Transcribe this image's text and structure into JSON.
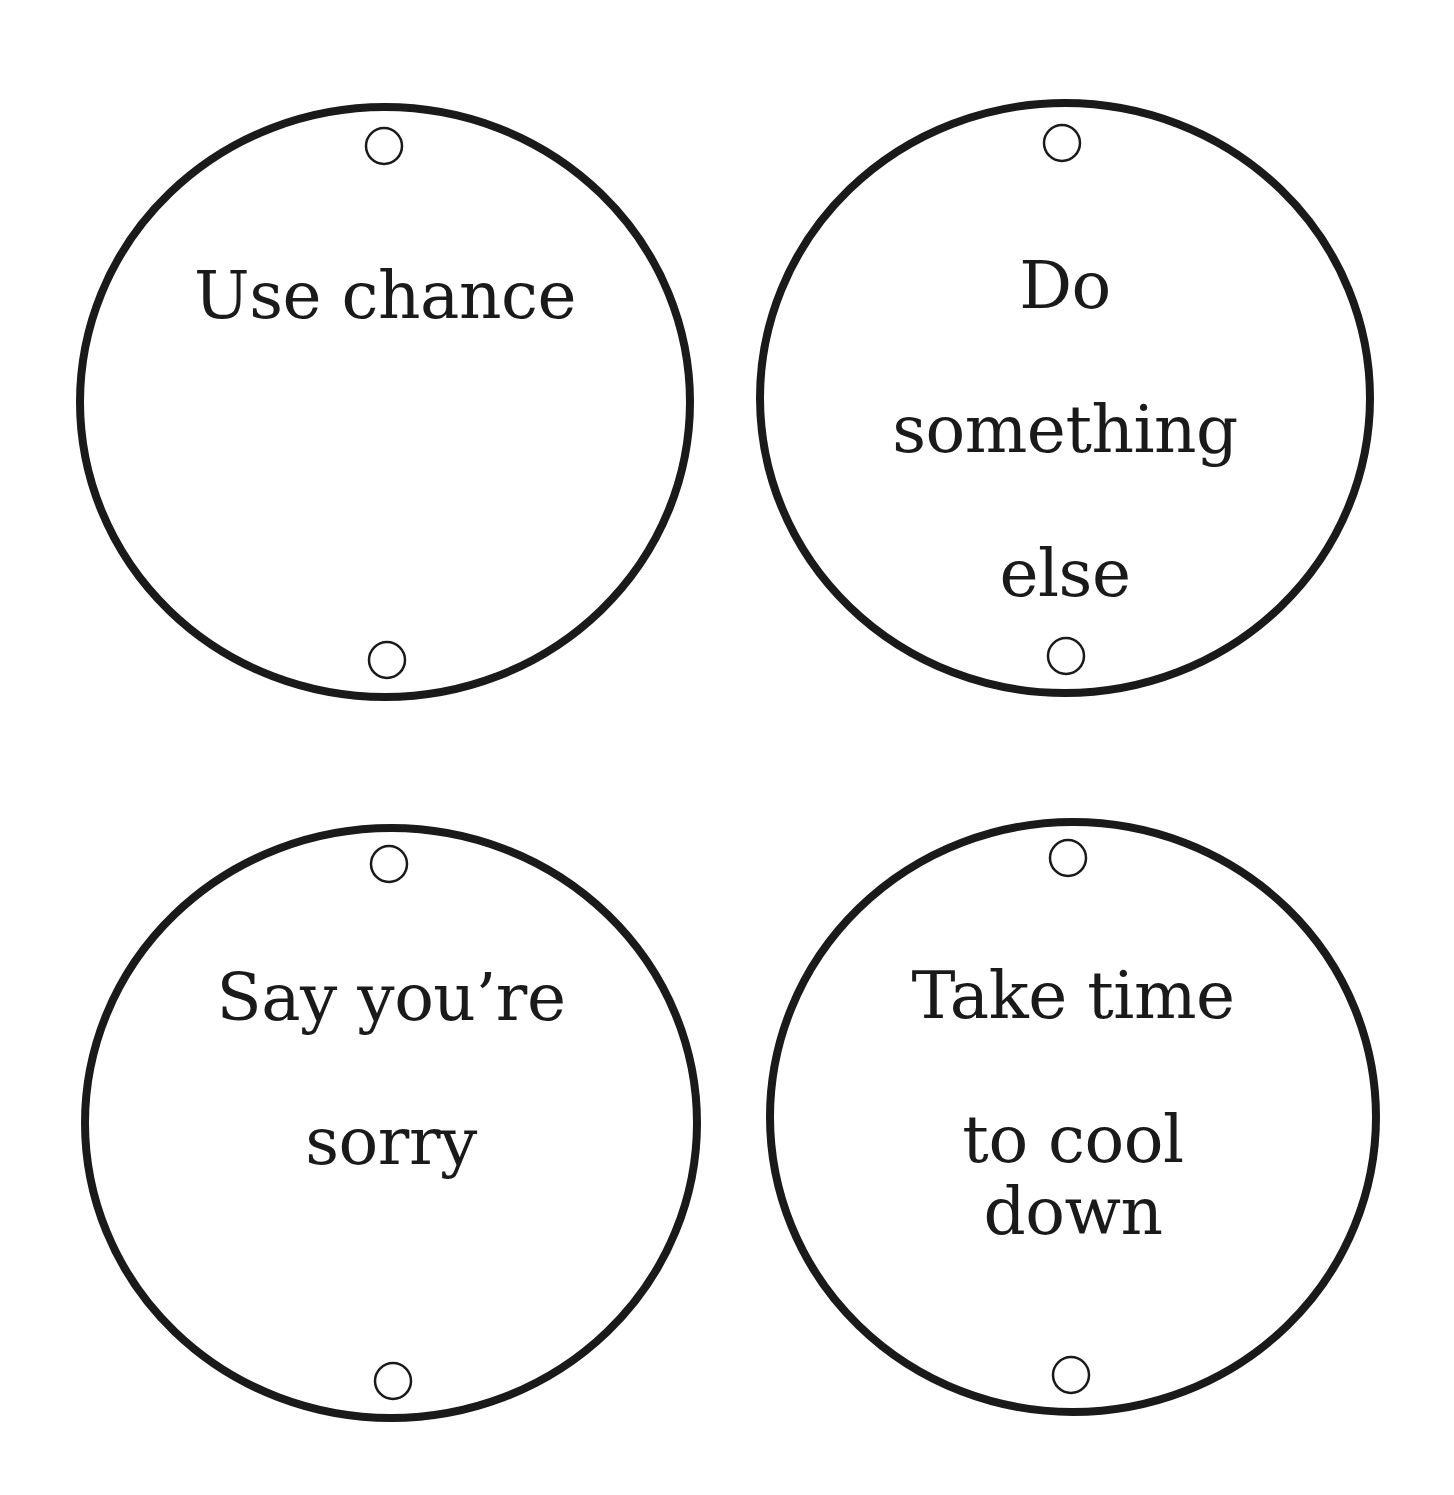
{
  "page": {
    "width": 1454,
    "height": 1495,
    "background": "#ffffff",
    "ink_color": "#1a1a1a"
  },
  "cards": [
    {
      "id": "use-chance",
      "label": "Use chance",
      "lines": [
        "Use chance"
      ],
      "circle": {
        "cx": 385,
        "cy": 402,
        "rx": 305,
        "ry": 295
      },
      "holes": [
        {
          "cx": 384,
          "cy": 146,
          "r": 18
        },
        {
          "cx": 387,
          "cy": 660,
          "r": 18
        }
      ],
      "text_top": 188
    },
    {
      "id": "do-something-else",
      "label": "Do something else",
      "lines": [
        "Do",
        "something",
        "else"
      ],
      "circle": {
        "cx": 1065,
        "cy": 398,
        "rx": 305,
        "ry": 295
      },
      "holes": [
        {
          "cx": 1062,
          "cy": 143,
          "r": 18
        },
        {
          "cx": 1066,
          "cy": 656,
          "r": 18
        }
      ],
      "text_top": 178
    },
    {
      "id": "say-youre-sorry",
      "label": "Say you’re sorry",
      "lines": [
        "Say you’re",
        "sorry"
      ],
      "circle": {
        "cx": 391,
        "cy": 1123,
        "rx": 306,
        "ry": 295
      },
      "holes": [
        {
          "cx": 389,
          "cy": 864,
          "r": 18
        },
        {
          "cx": 393,
          "cy": 1381,
          "r": 18
        }
      ],
      "text_top": 890
    },
    {
      "id": "take-time-to-cool-down",
      "label": "Take time to cool down",
      "lines": [
        "Take time",
        "to cool down"
      ],
      "circle": {
        "cx": 1073,
        "cy": 1117,
        "rx": 303,
        "ry": 295
      },
      "holes": [
        {
          "cx": 1068,
          "cy": 858,
          "r": 18
        },
        {
          "cx": 1071,
          "cy": 1375,
          "r": 18
        }
      ],
      "text_top": 888
    }
  ]
}
